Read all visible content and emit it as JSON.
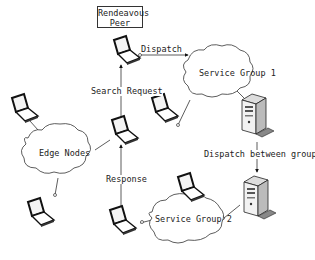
{
  "diagram": {
    "rendezvous_peer": {
      "line1": "Rendeavous",
      "line2": "Peer"
    },
    "clouds": {
      "edge_nodes": "Edge Nodes",
      "service_group_1": "Service Group 1",
      "service_group_2": "Service Group 2"
    },
    "edges": {
      "dispatch": "Dispatch",
      "search_request": "Search Request",
      "response": "Response",
      "dispatch_between_groups": "Dispatch between groups"
    },
    "colors": {
      "line": "#333333",
      "laptop_screen": "#222222",
      "server_body": "#e8e8e8"
    }
  }
}
